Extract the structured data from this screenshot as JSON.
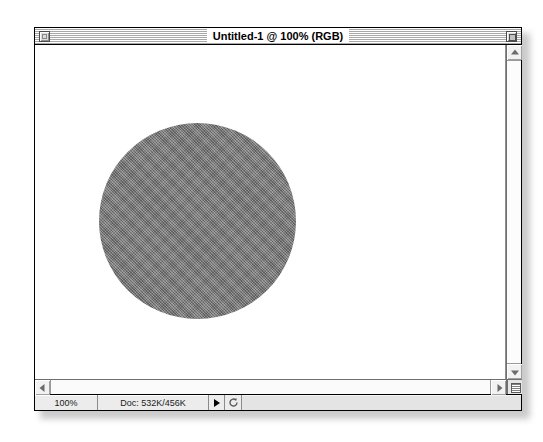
{
  "window": {
    "title": "Untitled-1 @ 100% (RGB)",
    "close_box_name": "close-box",
    "zoom_box_name": "zoom-box"
  },
  "canvas": {
    "shape": "circle",
    "fill_color": "#7d7d7d",
    "background_color": "#ffffff",
    "texture": "dithered-halftone"
  },
  "statusbar": {
    "zoom_level": "100%",
    "doc_info": "Doc: 532K/456K",
    "play_label": "▶",
    "cycle_label": "↻"
  },
  "scrollbars": {
    "up_arrow": "▲",
    "down_arrow": "▼",
    "left_arrow": "◀",
    "right_arrow": "▶"
  }
}
